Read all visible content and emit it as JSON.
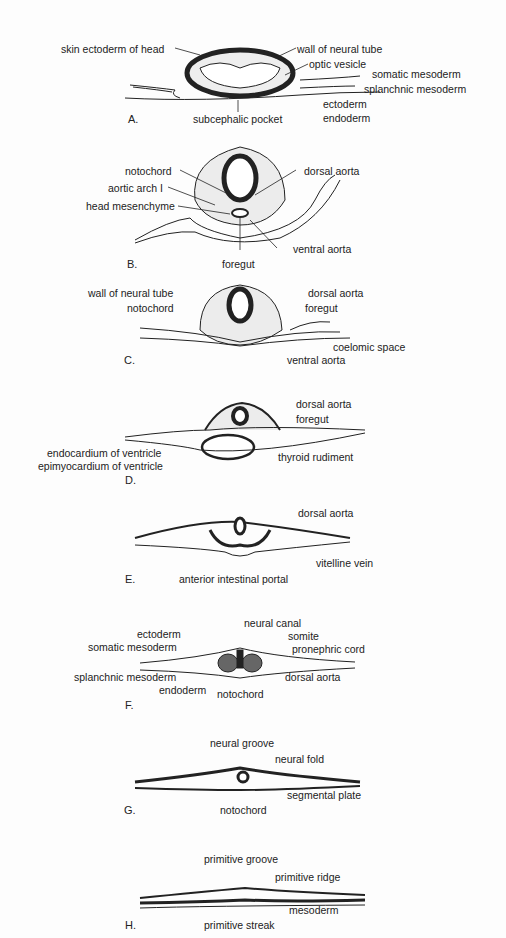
{
  "panels": [
    {
      "id": "A",
      "label": "A.",
      "annotations": [
        "skin ectoderm of head",
        "wall of neural tube",
        "optic vesicle",
        "somatic mesoderm",
        "splanchnic mesoderm",
        "ectoderm",
        "endoderm",
        "subcephalic pocket"
      ]
    },
    {
      "id": "B",
      "label": "B.",
      "annotations": [
        "notochord",
        "aortic arch I",
        "head mesenchyme",
        "dorsal aorta",
        "ventral aorta",
        "foregut"
      ]
    },
    {
      "id": "C",
      "label": "C.",
      "annotations": [
        "wall of neural tube",
        "notochord",
        "dorsal aorta",
        "foregut",
        "coelomic space",
        "ventral aorta"
      ]
    },
    {
      "id": "D",
      "label": "D.",
      "annotations": [
        "dorsal aorta",
        "foregut",
        "endocardium of ventricle",
        "epimyocardium of ventricle",
        "thyroid rudiment"
      ]
    },
    {
      "id": "E",
      "label": "E.",
      "annotations": [
        "dorsal aorta",
        "vitelline vein",
        "anterior intestinal portal"
      ]
    },
    {
      "id": "F",
      "label": "F.",
      "annotations": [
        "neural canal",
        "ectoderm",
        "somite",
        "somatic mesoderm",
        "pronephric cord",
        "splanchnic mesoderm",
        "dorsal aorta",
        "endoderm",
        "notochord"
      ]
    },
    {
      "id": "G",
      "label": "G.",
      "annotations": [
        "neural groove",
        "neural fold",
        "segmental plate",
        "notochord"
      ]
    },
    {
      "id": "H",
      "label": "H.",
      "annotations": [
        "primitive groove",
        "primitive ridge",
        "mesoderm",
        "primitive streak"
      ]
    }
  ]
}
